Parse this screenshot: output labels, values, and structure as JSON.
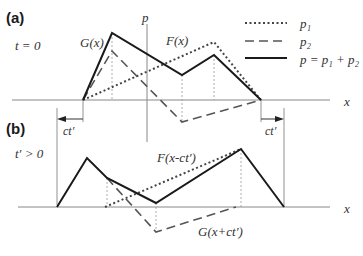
{
  "panel_a": {
    "label": "(a)",
    "time_label": "t = 0",
    "axis_p_label": "p",
    "axis_x_label": "x",
    "curve_g_label": "G(x)",
    "curve_f_label": "F(x)"
  },
  "panel_b": {
    "label": "(b)",
    "time_label": "t′ > 0",
    "axis_x_label": "x",
    "curve_f_label": "F(x-ct′)",
    "curve_g_label": "G(x+ct′)",
    "shift_left_label": "ct′",
    "shift_right_label": "ct′"
  },
  "legend": {
    "items": [
      {
        "style": "dotted",
        "label": "p₁"
      },
      {
        "style": "dashed",
        "label": "p₂"
      },
      {
        "style": "solid",
        "label": "p = p₁ + p₂"
      }
    ]
  },
  "colors": {
    "solid": "#1a1a1a",
    "dashed": "#555555",
    "dotted": "#444444",
    "axis": "#777777",
    "guide": "#999999"
  }
}
